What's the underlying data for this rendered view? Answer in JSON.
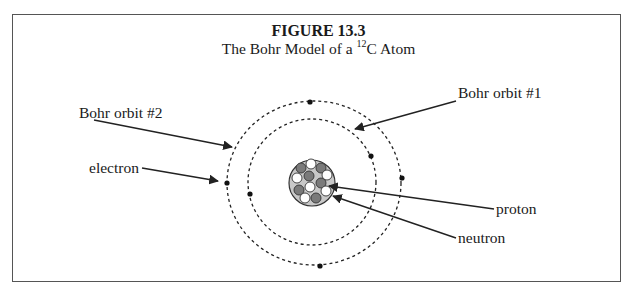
{
  "figure": {
    "number_label": "FIGURE 13.3",
    "subtitle_prefix": "The Bohr Model of a ",
    "isotope_mass_number": "12",
    "element_symbol": "C",
    "subtitle_suffix": " Atom"
  },
  "labels": {
    "bohr_orbit_2": "Bohr orbit #2",
    "bohr_orbit_1": "Bohr orbit #1",
    "electron": "electron",
    "proton": "proton",
    "neutron": "neutron"
  },
  "atom": {
    "protons": 6,
    "neutrons": 6,
    "electrons_inner_orbit": 2,
    "electrons_outer_orbit": 4
  },
  "colors": {
    "border": "#555555",
    "nucleus_fill": "#c8c8c8",
    "neutron_fill": "#7a7a7a",
    "proton_fill": "#ffffff",
    "line": "#222222"
  }
}
